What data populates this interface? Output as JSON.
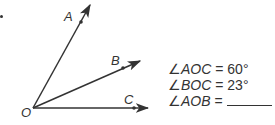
{
  "diagram": {
    "vertex": {
      "label": "O"
    },
    "rays": [
      {
        "label": "A",
        "angle_from_OC_deg": 60
      },
      {
        "label": "B",
        "angle_from_OC_deg": 23
      },
      {
        "label": "C",
        "angle_from_OC_deg": 0
      }
    ]
  },
  "equations": [
    {
      "angle_symbol": "∠",
      "name": "AOC",
      "equals": " = ",
      "value": "60°"
    },
    {
      "angle_symbol": "∠",
      "name": "BOC",
      "equals": " = ",
      "value": "23°"
    },
    {
      "angle_symbol": "∠",
      "name": "AOB",
      "equals": " = ",
      "value": ""
    }
  ],
  "colors": {
    "stroke": "#333333",
    "background": "#ffffff"
  }
}
